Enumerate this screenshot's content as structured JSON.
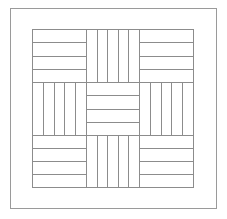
{
  "figure": {
    "type": "line-drawing",
    "width": 227,
    "height": 219,
    "background_color": "#ffffff",
    "line_color": "#8c8c8c",
    "outer_border_color": "#9a9a9a",
    "line_width": 1
  },
  "outer_frame": {
    "name": "outer-border",
    "x": 10,
    "y": 8,
    "width": 206,
    "height": 200
  },
  "block_area": {
    "name": "pieced-block-area",
    "x": 32,
    "y": 29,
    "width": 161,
    "height": 158
  },
  "grid": {
    "columns": 3,
    "rows": 3,
    "col_edges": [
      32,
      86,
      139,
      193
    ],
    "row_edges": [
      29,
      82,
      135,
      187
    ]
  },
  "blocks": [
    {
      "name": "block-top-left",
      "row": 0,
      "col": 0,
      "orientation": "horizontal",
      "strips": 4
    },
    {
      "name": "block-top-center",
      "row": 0,
      "col": 1,
      "orientation": "vertical",
      "strips": 5
    },
    {
      "name": "block-top-right",
      "row": 0,
      "col": 2,
      "orientation": "horizontal",
      "strips": 4
    },
    {
      "name": "block-middle-left",
      "row": 1,
      "col": 0,
      "orientation": "vertical",
      "strips": 5
    },
    {
      "name": "block-center",
      "row": 1,
      "col": 1,
      "orientation": "horizontal",
      "strips": 4
    },
    {
      "name": "block-middle-right",
      "row": 1,
      "col": 2,
      "orientation": "vertical",
      "strips": 5
    },
    {
      "name": "block-bottom-left",
      "row": 2,
      "col": 0,
      "orientation": "horizontal",
      "strips": 4
    },
    {
      "name": "block-bottom-center",
      "row": 2,
      "col": 1,
      "orientation": "vertical",
      "strips": 5
    },
    {
      "name": "block-bottom-right",
      "row": 2,
      "col": 2,
      "orientation": "horizontal",
      "strips": 4
    }
  ]
}
